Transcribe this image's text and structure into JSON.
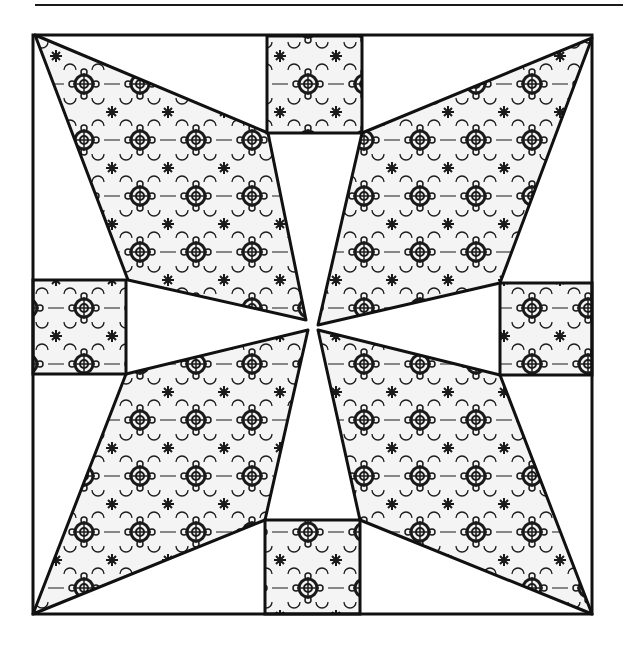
{
  "figure": {
    "type": "quilt-block-diagram",
    "colors": {
      "background": "#ffffff",
      "outline": "#111111",
      "pattern_ink": "#1a1a1a",
      "pattern_ground": "#f2f2f2"
    },
    "block": {
      "x": 33,
      "y": 35,
      "width": 559,
      "height": 579
    },
    "center": {
      "x": 313,
      "y": 325
    },
    "squares": [
      {
        "name": "top",
        "x": 267,
        "y": 36,
        "w": 95,
        "h": 97
      },
      {
        "name": "bottom",
        "x": 265,
        "y": 520,
        "w": 95,
        "h": 94
      },
      {
        "name": "left",
        "x": 33,
        "y": 280,
        "w": 93,
        "h": 94
      },
      {
        "name": "right",
        "x": 500,
        "y": 283,
        "w": 92,
        "h": 92
      }
    ],
    "kites": [
      {
        "name": "top-left",
        "points": "35,35 268,133 306,320 128,280"
      },
      {
        "name": "top-right",
        "points": "592,38 500,283 318,325 362,133"
      },
      {
        "name": "bottom-right",
        "points": "592,614 360,520 318,330 500,375"
      },
      {
        "name": "bottom-left",
        "points": "33,614 126,374 308,330 265,520"
      }
    ]
  }
}
